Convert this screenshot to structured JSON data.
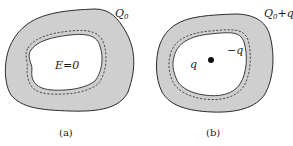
{
  "panels": [
    {
      "id": "a",
      "caption": "(a)",
      "outer_charge_label": "Q",
      "outer_charge_sub": "0",
      "outer_charge_suffix": "",
      "cavity_label": "E=0"
    },
    {
      "id": "b",
      "caption": "(b)",
      "outer_charge_label": "Q",
      "outer_charge_sub": "0",
      "outer_charge_suffix": "+q",
      "point_charge_label": "q",
      "induced_charge_label": "−q"
    }
  ],
  "colors": {
    "conductor_fill": "#cfcfcf",
    "outline": "#2a2a2a",
    "cavity_fill": "#ffffff",
    "dashed": "#2a2a2a"
  }
}
